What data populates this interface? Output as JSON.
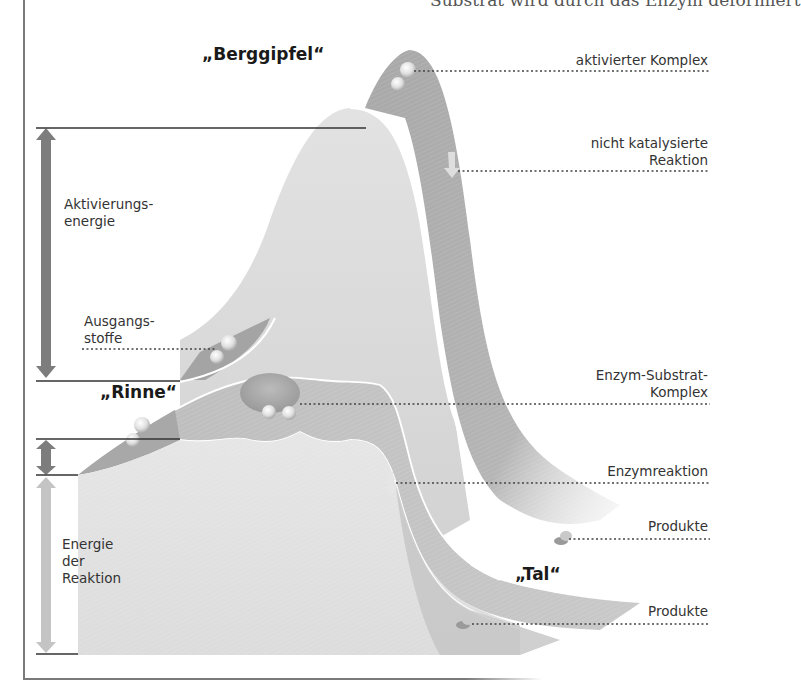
{
  "header": {
    "cut_off_text": "Substrat wird durch das Enzym deformiert"
  },
  "labels": {
    "peak": "„Berggipfel“",
    "groove": "„Rinne“",
    "valley": "„Tal“",
    "activation_energy": "Aktivierungs-\nenergie",
    "reactants": "Ausgangs-\nstoffe",
    "reaction_energy": "Energie\nder\nReaktion"
  },
  "callouts": [
    {
      "id": "activated-complex",
      "text": "aktivierter Komplex"
    },
    {
      "id": "uncatalyzed-reaction",
      "text": "nicht katalysierte\nReaktion"
    },
    {
      "id": "enzyme-substrate-complex",
      "text": "Enzym-Substrat-\nKomplex"
    },
    {
      "id": "enzyme-reaction",
      "text": "Enzymreaktion"
    },
    {
      "id": "products-upper",
      "text": "Produkte"
    },
    {
      "id": "products-lower",
      "text": "Produkte"
    }
  ],
  "colors": {
    "surface_light": "#e4e4e4",
    "surface_mid": "#cfcfcf",
    "surface_dark": "#a9a9a9",
    "arrow_dark": "#7d7d7d",
    "arrow_light": "#c4c4c4",
    "frame": "#7a7a7a"
  }
}
